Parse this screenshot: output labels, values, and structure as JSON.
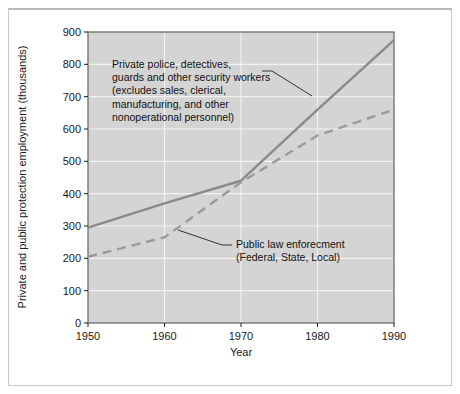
{
  "chart_data": {
    "type": "line",
    "title": "",
    "subtitle": "",
    "xlabel": "Year",
    "ylabel": "Private and public protection employment (thousands)",
    "x": [
      1950,
      1960,
      1970,
      1980,
      1990
    ],
    "xlim": [
      1950,
      1990
    ],
    "ylim": [
      0,
      900
    ],
    "xticks": [
      "1950",
      "1960",
      "1970",
      "1980",
      "1990"
    ],
    "yticks": [
      "0",
      "100",
      "200",
      "300",
      "400",
      "500",
      "600",
      "700",
      "800",
      "900"
    ],
    "grid": true,
    "legend_position": "none",
    "series": [
      {
        "name": "Private police, detectives, guards and other security workers",
        "style": "solid",
        "color": "#8a8a8a",
        "values": [
          295,
          370,
          440,
          660,
          875
        ]
      },
      {
        "name": "Public law enforcement (Federal, State, Local)",
        "style": "dashed",
        "color": "#9a9a9a",
        "values": [
          205,
          265,
          435,
          580,
          660
        ]
      }
    ],
    "annotations": [
      {
        "id": "private-annotation",
        "lines": [
          "Private police, detectives,",
          "guards and other security workers",
          "(excludes sales, clerical,",
          "manufacturing, and other",
          "nonoperational personnel)"
        ]
      },
      {
        "id": "public-annotation",
        "lines": [
          "Public law enforecment",
          "(Federal, State, Local)"
        ]
      }
    ],
    "colors": {
      "plot_background": "#d4d4d4",
      "gridline": "#f2f2f2",
      "plot_border": "#6e6e6e",
      "page_background": "#ffffff",
      "frame_border": "#c9c9c9",
      "text": "#1a1a1a",
      "leader_line": "#333333"
    }
  }
}
